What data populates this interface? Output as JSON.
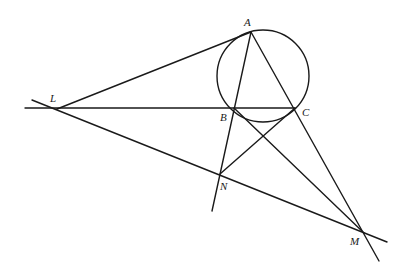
{
  "diagram": {
    "title": "",
    "points": {
      "A": {
        "label": "A",
        "x": 251,
        "y": 32,
        "lx": 244,
        "ly": 26
      },
      "B": {
        "label": "B",
        "x": 234,
        "y": 108,
        "lx": 220,
        "ly": 121
      },
      "C": {
        "label": "C",
        "x": 295,
        "y": 108,
        "lx": 302,
        "ly": 116
      },
      "L": {
        "label": "L",
        "x": 57,
        "y": 109,
        "lx": 50,
        "ly": 102
      },
      "N": {
        "label": "N",
        "x": 220,
        "y": 174,
        "lx": 220,
        "ly": 190
      },
      "M": {
        "label": "M",
        "x": 364,
        "y": 233,
        "lx": 350,
        "ly": 245
      }
    },
    "circle": {
      "cx": 263,
      "cy": 76,
      "r": 46
    },
    "lines": [
      {
        "name": "line-L-A",
        "x1": 57,
        "y1": 109,
        "x2": 251,
        "y2": 32
      },
      {
        "name": "line-L-C",
        "x1": 25,
        "y1": 108,
        "x2": 295,
        "y2": 108
      },
      {
        "name": "line-L-M",
        "x1": 32,
        "y1": 100,
        "x2": 387,
        "y2": 242
      },
      {
        "name": "line-A-N",
        "x1": 251,
        "y1": 32,
        "x2": 212,
        "y2": 211
      },
      {
        "name": "line-A-M",
        "x1": 251,
        "y1": 32,
        "x2": 379,
        "y2": 261
      },
      {
        "name": "line-C-N",
        "x1": 295,
        "y1": 108,
        "x2": 220,
        "y2": 174
      },
      {
        "name": "line-B-M",
        "x1": 234,
        "y1": 108,
        "x2": 364,
        "y2": 233
      }
    ]
  }
}
